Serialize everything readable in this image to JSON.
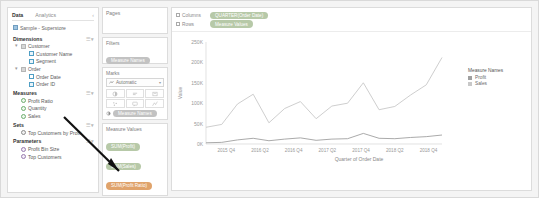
{
  "left_pane": {
    "tabs": {
      "data": "Data",
      "analytics": "Analytics",
      "collapse_icon": "chevron-left-icon"
    },
    "datasource": "Sample - Superstore",
    "sections": [
      {
        "title": "Dimensions",
        "fields": [
          {
            "label": "Customer",
            "type": "folder",
            "level": 1,
            "expander": "▾"
          },
          {
            "label": "Customer Name",
            "type": "abc",
            "level": 2,
            "expander": ""
          },
          {
            "label": "Segment",
            "type": "abc",
            "level": 2,
            "expander": ""
          },
          {
            "label": "Order",
            "type": "folder",
            "level": 1,
            "expander": "▾"
          },
          {
            "label": "Order Date",
            "type": "cal",
            "level": 2,
            "expander": ""
          },
          {
            "label": "Order ID",
            "type": "abc",
            "level": 2,
            "expander": ""
          }
        ]
      },
      {
        "title": "Measures",
        "fields": [
          {
            "label": "Profit Ratio",
            "type": "num",
            "level": 1,
            "expander": ""
          },
          {
            "label": "Quantity",
            "type": "num",
            "level": 1,
            "expander": ""
          },
          {
            "label": "Sales",
            "type": "num",
            "level": 1,
            "expander": ""
          }
        ]
      },
      {
        "title": "Sets",
        "fields": [
          {
            "label": "Top Customers by Profit",
            "type": "set",
            "level": 1,
            "expander": ""
          }
        ]
      },
      {
        "title": "Parameters",
        "fields": [
          {
            "label": "Profit Bin Size",
            "type": "prm",
            "level": 1,
            "expander": ""
          },
          {
            "label": "Top Customers",
            "type": "prm",
            "level": 1,
            "expander": ""
          }
        ]
      }
    ]
  },
  "shelves": {
    "pages_label": "Pages",
    "filters_label": "Filters",
    "filter_pills": [
      {
        "label": "Measure Names",
        "color": "grey"
      }
    ],
    "columns_label": "Columns",
    "rows_label": "Rows",
    "columns_pills": [
      {
        "label": "QUARTER(Order Date)",
        "color": "green"
      }
    ],
    "rows_pills": [
      {
        "label": "Measure Values",
        "color": "green"
      }
    ]
  },
  "marks": {
    "title": "Marks",
    "mark_type": "Automatic",
    "mark_type_icon": "line-mark-icon",
    "buttons": [
      "color-icon",
      "size-icon",
      "label-icon",
      "detail-icon",
      "tooltip-icon",
      "path-icon"
    ],
    "pills": [
      {
        "label": "Measure Names",
        "color": "grey",
        "icon": "color-icon"
      }
    ]
  },
  "measure_values": {
    "title": "Measure Values",
    "pills": [
      {
        "label": "SUM(Profit)",
        "color": "green"
      },
      {
        "label": "SUM(Sales)",
        "color": "green"
      },
      {
        "label": "SUM(Profit Ratio)",
        "color": "orange"
      }
    ]
  },
  "legend": {
    "title": "Measure Names",
    "items": [
      {
        "label": "Profit",
        "color": "#a0a0a0"
      },
      {
        "label": "Sales",
        "color": "#c8c8c8"
      }
    ]
  },
  "chart_data": {
    "type": "line",
    "title": "",
    "xlabel": "Quarter of Order Date",
    "ylabel": "Value",
    "x": [
      "2015 Q1",
      "2015 Q2",
      "2015 Q3",
      "2015 Q4",
      "2016 Q1",
      "2016 Q2",
      "2016 Q3",
      "2016 Q4",
      "2017 Q1",
      "2017 Q2",
      "2017 Q3",
      "2017 Q4",
      "2018 Q1",
      "2018 Q2",
      "2018 Q3",
      "2018 Q4"
    ],
    "xticks": [
      "2015 Q4",
      "2016 Q2",
      "2016 Q4",
      "2017 Q2",
      "2017 Q4",
      "2018 Q2",
      "2018 Q4"
    ],
    "yticks": [
      "250K",
      "200K",
      "150K",
      "100K",
      "50K",
      "0K"
    ],
    "ylim": [
      0,
      250000
    ],
    "grid": false,
    "legend_position": "right",
    "series": [
      {
        "name": "Sales",
        "color": "#c8c8c8",
        "values": [
          41000,
          48000,
          98000,
          122000,
          52000,
          87000,
          104000,
          62000,
          93000,
          100000,
          150000,
          84000,
          92000,
          120000,
          145000,
          212000
        ]
      },
      {
        "name": "Profit",
        "color": "#a0a0a0",
        "values": [
          3000,
          4000,
          10000,
          14000,
          8000,
          12000,
          15000,
          9000,
          12000,
          13000,
          26000,
          14000,
          13000,
          16000,
          18000,
          22000
        ]
      }
    ]
  }
}
